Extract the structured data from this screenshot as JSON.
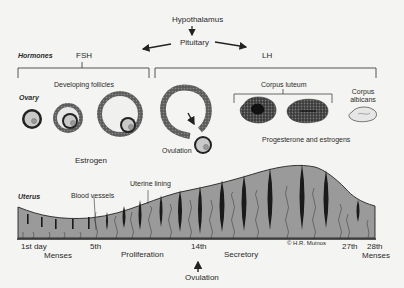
{
  "diagram": {
    "top": {
      "hypothalamus": "Hypothalamus",
      "pituitary": "Pituitary"
    },
    "rows": {
      "hormones": "Hormones",
      "ovary": "Ovary",
      "uterus": "Uterus"
    },
    "hormones": {
      "fsh": "FSH",
      "lh": "LH"
    },
    "ovary": {
      "developing_follicles": "Developing follicles",
      "estrogen": "Estrogen",
      "ovulation": "Ovulation",
      "corpus_luteum": "Corpus luteum",
      "corpus_albicans_line1": "Corpus",
      "corpus_albicans_line2": "albicans",
      "progesterone_estrogens": "Progesterone and estrogens"
    },
    "uterus": {
      "blood_vessels": "Blood vessels",
      "uterine_lining": "Uterine lining",
      "credit": "© H.R. Muinos"
    },
    "timeline": {
      "day1": "1st day",
      "day5": "5th",
      "day14": "14th",
      "day27": "27th",
      "day28": "28th",
      "menses_start": "Menses",
      "proliferation": "Proliferation",
      "secretory": "Secretory",
      "ovulation": "Ovulation",
      "menses_end": "Menses"
    },
    "colors": {
      "background": "#f4f4f2",
      "lining_fill": "#9a9a9a",
      "ink": "#222222",
      "follicle_ring": "#5a5a5a",
      "oocyte": "#c8c8c8"
    }
  }
}
